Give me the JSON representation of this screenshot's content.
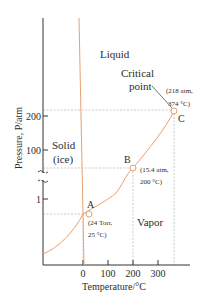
{
  "diagram": {
    "regions": {
      "liquid": "Liquid",
      "solid_line1": "Solid",
      "solid_line2": "(ice)",
      "vapor": "Vapor"
    },
    "critical_label": {
      "line1": "Critical",
      "line2": "point"
    },
    "points": {
      "A": {
        "label": "A",
        "note1": "(24 Torr,",
        "note2": "25 °C)"
      },
      "B": {
        "label": "B",
        "note1": "(15.4 atm,",
        "note2": "200 °C)"
      },
      "C": {
        "label": "C",
        "note1": "(218 atm,",
        "note2": "374 °C)"
      }
    },
    "axes": {
      "ylabel": "Pressure, P/atm",
      "xlabel": "Temperature/°C",
      "yticks": [
        "200",
        "100",
        "1"
      ],
      "xticks": [
        "0",
        "100",
        "200",
        "300"
      ]
    },
    "colors": {
      "curve": "#e8a070",
      "axis": "#333333",
      "dashed": "#999999"
    }
  }
}
